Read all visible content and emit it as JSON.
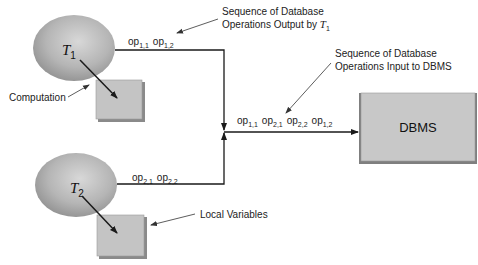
{
  "diagram": {
    "transactions": [
      {
        "name": "T",
        "subscript": "1",
        "ops": [
          {
            "base": "op",
            "sub": "1,1"
          },
          {
            "base": "op",
            "sub": "1,2"
          }
        ]
      },
      {
        "name": "T",
        "subscript": "2",
        "ops": [
          {
            "base": "op",
            "sub": "2,1"
          },
          {
            "base": "op",
            "sub": "2,2"
          }
        ]
      }
    ],
    "merged_ops": [
      {
        "base": "op",
        "sub": "1,1"
      },
      {
        "base": "op",
        "sub": "2,1"
      },
      {
        "base": "op",
        "sub": "2,2"
      },
      {
        "base": "op",
        "sub": "1,2"
      }
    ],
    "dbms_label": "DBMS",
    "annotations": {
      "output_t1_line1": "Sequence of Database",
      "output_t1_line2": "Operations Output by ",
      "output_t1_var": "T",
      "output_t1_sub": "1",
      "input_dbms_line1": "Sequence of Database",
      "input_dbms_line2": "Operations Input to DBMS",
      "computation": "Computation",
      "local_variables": "Local Variables"
    },
    "colors": {
      "ellipse_fill": "#b8b8b8",
      "box_fill": "#c4c4c4",
      "box_shadow": "#8a8a8a",
      "line": "#1a1a1a"
    }
  }
}
